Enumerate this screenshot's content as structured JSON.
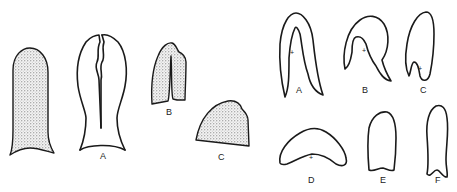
{
  "plate": {
    "left_group": {
      "figures": [
        {
          "id": "unlabeled",
          "label": ""
        },
        {
          "id": "A",
          "label": "A"
        },
        {
          "id": "B",
          "label": "B"
        },
        {
          "id": "C",
          "label": "C"
        }
      ]
    },
    "right_group": {
      "figures": [
        {
          "id": "A",
          "label": "A"
        },
        {
          "id": "B",
          "label": "B"
        },
        {
          "id": "C",
          "label": "C"
        },
        {
          "id": "D",
          "label": "D"
        },
        {
          "id": "E",
          "label": "E"
        },
        {
          "id": "F",
          "label": "F"
        }
      ]
    },
    "center_mark": "+"
  }
}
